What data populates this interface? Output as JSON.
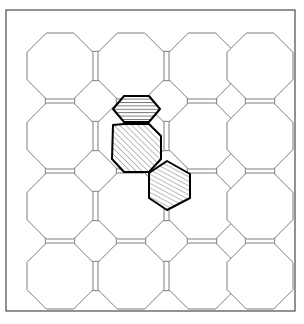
{
  "figure": {
    "caption": "",
    "canvas": {
      "width": 304,
      "height": 324,
      "background": "#ffffff"
    }
  },
  "frame": {
    "name": "outer-border",
    "x": 6,
    "y": 10,
    "width": 289,
    "height": 301,
    "stroke": "#3a3a3a",
    "stroke_width": 1.1,
    "fill": "none"
  },
  "style": {
    "tile_stroke": "#6e6e6e",
    "tile_stroke_width": 0.9,
    "tile_fill": "#ffffff",
    "highlight_stroke": "#000000",
    "highlight_stroke_width": 2.0,
    "hatch_stroke": "#4a4a4a",
    "hatch_stroke_width": 0.7
  },
  "grid": {
    "description": "4x4 array of regular octagons with hexagons filling the interstices",
    "octagon_columns": 4,
    "octagon_rows": 4,
    "octagon_centers_x": [
      60,
      131,
      202,
      250
    ],
    "octagon_centers_y": [
      66,
      160,
      230,
      276
    ],
    "pitch_x": 71,
    "pitch_y": 70,
    "octagon_radius": 33,
    "origin_x": 25,
    "origin_y": 31
  },
  "tiles": {
    "octagons": [
      {
        "id": "oct-r0c0",
        "row": 0,
        "col": 0,
        "cx": 60,
        "cy": 66,
        "highlight": false
      },
      {
        "id": "oct-r0c1",
        "row": 0,
        "col": 1,
        "cx": 131,
        "cy": 66,
        "highlight": false
      },
      {
        "id": "oct-r0c2",
        "row": 0,
        "col": 2,
        "cx": 202,
        "cy": 66,
        "highlight": false
      },
      {
        "id": "oct-r0c3",
        "row": 0,
        "col": 3,
        "cx": 260,
        "cy": 66,
        "highlight": false
      },
      {
        "id": "oct-r1c0",
        "row": 1,
        "col": 0,
        "cx": 60,
        "cy": 136,
        "highlight": false
      },
      {
        "id": "oct-r1c1",
        "row": 1,
        "col": 1,
        "cx": 131,
        "cy": 136,
        "highlight": true,
        "hatch": "diagonal-45"
      },
      {
        "id": "oct-r1c2",
        "row": 1,
        "col": 2,
        "cx": 202,
        "cy": 136,
        "highlight": false
      },
      {
        "id": "oct-r1c3",
        "row": 1,
        "col": 3,
        "cx": 260,
        "cy": 136,
        "highlight": false
      },
      {
        "id": "oct-r2c0",
        "row": 2,
        "col": 0,
        "cx": 60,
        "cy": 206,
        "highlight": false
      },
      {
        "id": "oct-r2c1",
        "row": 2,
        "col": 1,
        "cx": 131,
        "cy": 206,
        "highlight": false
      },
      {
        "id": "oct-r2c2",
        "row": 2,
        "col": 2,
        "cx": 202,
        "cy": 206,
        "highlight": false
      },
      {
        "id": "oct-r2c3",
        "row": 2,
        "col": 3,
        "cx": 260,
        "cy": 206,
        "highlight": false
      },
      {
        "id": "oct-r3c0",
        "row": 3,
        "col": 0,
        "cx": 60,
        "cy": 276,
        "highlight": false
      },
      {
        "id": "oct-r3c1",
        "row": 3,
        "col": 1,
        "cx": 131,
        "cy": 276,
        "highlight": false
      },
      {
        "id": "oct-r3c2",
        "row": 3,
        "col": 2,
        "cx": 202,
        "cy": 276,
        "highlight": false
      },
      {
        "id": "oct-r3c3",
        "row": 3,
        "col": 3,
        "cx": 260,
        "cy": 276,
        "highlight": false
      }
    ],
    "hexagons_horizontal": [
      {
        "id": "hexh-r0c0",
        "cx": 95.5,
        "cy": 66,
        "highlight": false
      },
      {
        "id": "hexh-r0c1",
        "cx": 166.5,
        "cy": 66,
        "highlight": false
      },
      {
        "id": "hexh-r0c2",
        "cx": 231.0,
        "cy": 66,
        "highlight": false
      },
      {
        "id": "hexh-r1c0",
        "cx": 95.5,
        "cy": 136,
        "highlight": false
      },
      {
        "id": "hexh-r1c1",
        "cx": 166.5,
        "cy": 136,
        "highlight": false
      },
      {
        "id": "hexh-r1c2",
        "cx": 231.0,
        "cy": 136,
        "highlight": false
      },
      {
        "id": "hexh-r2c0",
        "cx": 95.5,
        "cy": 206,
        "highlight": false
      },
      {
        "id": "hexh-r2c1",
        "cx": 166.5,
        "cy": 206,
        "highlight": false
      },
      {
        "id": "hexh-r2c2",
        "cx": 231.0,
        "cy": 206,
        "highlight": false
      },
      {
        "id": "hexh-r3c0",
        "cx": 95.5,
        "cy": 276,
        "highlight": false
      },
      {
        "id": "hexh-r3c1",
        "cx": 166.5,
        "cy": 276,
        "highlight": false
      },
      {
        "id": "hexh-r3c2",
        "cx": 231.0,
        "cy": 276,
        "highlight": false
      }
    ],
    "hexagons_vertical": [
      {
        "id": "hexv-r0c0",
        "cx": 60,
        "cy": 101,
        "highlight": false
      },
      {
        "id": "hexv-r0c1",
        "cx": 131,
        "cy": 101,
        "highlight": true,
        "hatch": "horizontal"
      },
      {
        "id": "hexv-r0c2",
        "cx": 202,
        "cy": 101,
        "highlight": false
      },
      {
        "id": "hexv-r0c3",
        "cx": 260,
        "cy": 101,
        "highlight": false
      },
      {
        "id": "hexv-r1c0",
        "cx": 60,
        "cy": 171,
        "highlight": false
      },
      {
        "id": "hexv-r1c1",
        "cx": 131,
        "cy": 171,
        "highlight": false
      },
      {
        "id": "hexv-r1c2",
        "cx": 202,
        "cy": 171,
        "highlight": false
      },
      {
        "id": "hexv-r1c3",
        "cx": 260,
        "cy": 171,
        "highlight": false
      },
      {
        "id": "hexv-r2c0",
        "cx": 60,
        "cy": 241,
        "highlight": false
      },
      {
        "id": "hexv-r2c1",
        "cx": 131,
        "cy": 241,
        "highlight": false
      },
      {
        "id": "hexv-r2c2",
        "cx": 202,
        "cy": 241,
        "highlight": false
      },
      {
        "id": "hexv-r2c3",
        "cx": 260,
        "cy": 241,
        "highlight": false
      }
    ]
  },
  "highlighted": {
    "count": 3,
    "items": [
      {
        "id": "highlight-top-hexagon",
        "shape": "hexagon",
        "hatch": "horizontal",
        "points": "113,109 124,96 149,96 160,109 149,122 124,122",
        "label": "top hatched hexagon"
      },
      {
        "id": "highlight-center-octagon",
        "shape": "octagon",
        "hatch": "diagonal-45",
        "points": "113,125 124,124 149,124 161,136 161,159 149,172 124,172 112,159",
        "label": "center hatched octagon"
      },
      {
        "id": "highlight-lower-right-hexagon",
        "shape": "hexagon",
        "hatch": "diagonal-steep",
        "points": "149,173 167,161 190,174 190,198 167,210 149,198",
        "label": "lower-right hatched hexagon"
      }
    ]
  }
}
